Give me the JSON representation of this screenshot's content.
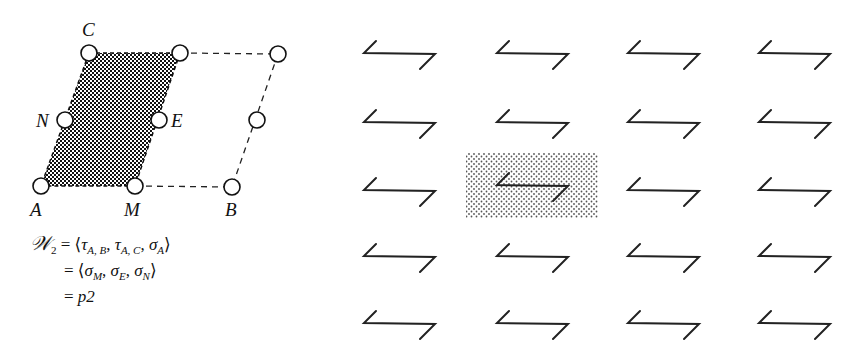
{
  "lattice": {
    "labels": {
      "C": "C",
      "N": "N",
      "E": "E",
      "A": "A",
      "M": "M",
      "B": "B"
    },
    "points": [
      {
        "name": "C",
        "x": 89,
        "y": 53
      },
      {
        "name": "top-mid",
        "x": 180,
        "y": 53
      },
      {
        "name": "top-right",
        "x": 278,
        "y": 54
      },
      {
        "name": "N",
        "x": 65,
        "y": 120
      },
      {
        "name": "E",
        "x": 159,
        "y": 120
      },
      {
        "name": "right-mid",
        "x": 257,
        "y": 120
      },
      {
        "name": "A",
        "x": 41,
        "y": 186
      },
      {
        "name": "M",
        "x": 135,
        "y": 186
      },
      {
        "name": "B",
        "x": 232,
        "y": 187
      }
    ]
  },
  "formula": {
    "group_symbol": "𝒲",
    "group_index": "2",
    "line1": {
      "eq": "=",
      "open": "⟨",
      "g1": "τ",
      "g1_sub": "A, B",
      "g2": "τ",
      "g2_sub": "A, C",
      "g3": "σ",
      "g3_sub": "A",
      "close": "⟩"
    },
    "line2": {
      "eq": "=",
      "open": "⟨",
      "g1": "σ",
      "g1_sub": "M",
      "g2": "σ",
      "g2_sub": "E",
      "g3": "σ",
      "g3_sub": "N",
      "close": "⟩"
    },
    "line3": {
      "eq": "=",
      "value": "p2"
    }
  },
  "pattern": {
    "rows": 5,
    "columns": 4,
    "col_x": [
      364,
      497,
      628,
      759
    ],
    "row_y": [
      53,
      122,
      190,
      256,
      323
    ],
    "highlighted_cell": {
      "row": 2,
      "column": 1
    },
    "motif_icon": "z-shaped-arrow-motif"
  }
}
